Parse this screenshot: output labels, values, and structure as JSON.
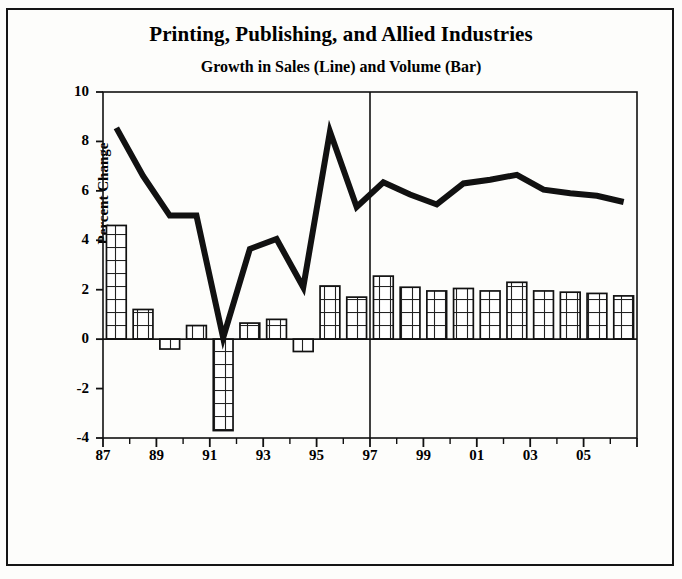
{
  "chart_data": {
    "type": "bar",
    "title": "Printing, Publishing, and Allied Industries",
    "subtitle": "Growth in Sales (Line) and Volume (Bar)",
    "xlabel": "",
    "ylabel": "Percent Change",
    "ylim": [
      -4,
      10
    ],
    "yticks": [
      10,
      8,
      6,
      4,
      2,
      0,
      -2,
      -4
    ],
    "ytick_labels": [
      "10",
      "8",
      "6",
      "4",
      "2",
      "0",
      "-2",
      "-4"
    ],
    "grid": false,
    "legend": "none",
    "categories": [
      "87",
      "88",
      "89",
      "90",
      "91",
      "92",
      "93",
      "94",
      "95",
      "96",
      "97",
      "98",
      "99",
      "00",
      "01",
      "02",
      "03",
      "04",
      "05",
      "06"
    ],
    "xtick_labels": [
      "87",
      "",
      "89",
      "",
      "91",
      "",
      "93",
      "",
      "95",
      "",
      "97",
      "",
      "99",
      "",
      "01",
      "",
      "03",
      "",
      "05",
      ""
    ],
    "series": [
      {
        "name": "Volume (Bar)",
        "type": "bar",
        "values": [
          4.6,
          1.2,
          -0.4,
          0.55,
          -3.7,
          0.65,
          0.8,
          -0.5,
          2.15,
          1.7,
          2.55,
          2.1,
          1.95,
          2.05,
          1.95,
          2.3,
          1.95,
          1.9,
          1.85,
          1.75
        ]
      },
      {
        "name": "Sales (Line)",
        "type": "line",
        "values": [
          8.55,
          6.6,
          5.0,
          5.0,
          0.05,
          3.65,
          4.05,
          2.1,
          8.4,
          5.35,
          6.35,
          5.85,
          5.45,
          6.3,
          6.45,
          6.65,
          6.05,
          5.9,
          5.8,
          5.55
        ]
      }
    ],
    "annotations": [
      {
        "name": "forecast-divider",
        "type": "vline",
        "x_category": "97",
        "note": "vertical rule separating history from forecast"
      }
    ],
    "colors": {
      "line": "#111111",
      "bar_fill": "#ffffff",
      "bar_edge": "#111111",
      "axis": "#111111",
      "background": "#fdfdfb"
    }
  }
}
